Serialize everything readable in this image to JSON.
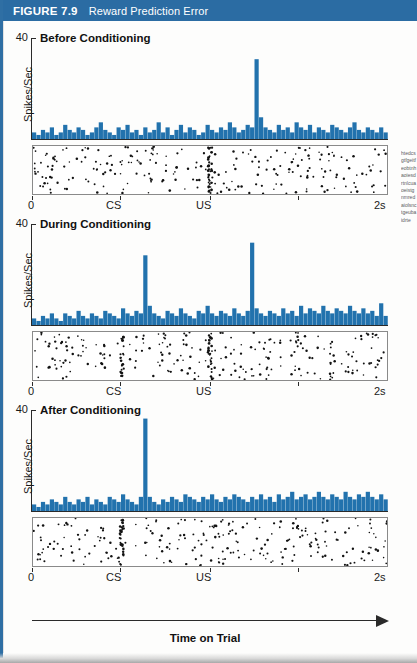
{
  "banner": {
    "figure_number": "FIGURE 7.9",
    "figure_title": "Reward Prediction Error",
    "background_color": "#2b6ca3",
    "text_color": "#ffffff"
  },
  "axes": {
    "y_max_label": "40",
    "y_axis_label": "Spikes/Sec",
    "x_tick_labels": [
      "0",
      "CS",
      "US",
      "2s"
    ],
    "x_axis_caption": "Time on Trial"
  },
  "colors": {
    "bar_blue": "#2272ad",
    "banner_blue": "#2b6ca3",
    "raster_dot": "#121212",
    "axis": "#2a2a2a"
  },
  "panels": [
    {
      "title": "Before Conditioning",
      "id": "before-conditioning"
    },
    {
      "title": "During Conditioning",
      "id": "during-conditioning"
    },
    {
      "title": "After Conditioning",
      "id": "after-conditioning"
    }
  ],
  "caption_sliver": "htedcsgtfgeitfeobtnhaoiesdrtnlcuaoeistgnmredaiolsnctgeubaidrte",
  "chart_data": {
    "type": "bar",
    "title": "Reward Prediction Error",
    "xlabel": "Time on Trial",
    "ylabel": "Spikes/Sec",
    "ylim": [
      0,
      40
    ],
    "xlim": [
      0,
      2
    ],
    "x_unit": "s",
    "grid": false,
    "legend": "none",
    "event_markers": {
      "CS": 0.5,
      "US": 1.0
    },
    "bin_width_s": 0.025,
    "n_bins": 80,
    "panels": [
      {
        "name": "Before Conditioning",
        "description": "Low irregular baseline firing with a large burst at the US (unpredicted reward).",
        "values": [
          3,
          2,
          4,
          3,
          5,
          2,
          3,
          6,
          4,
          3,
          5,
          4,
          2,
          3,
          5,
          7,
          4,
          3,
          2,
          5,
          4,
          6,
          3,
          4,
          2,
          5,
          3,
          4,
          7,
          3,
          5,
          2,
          4,
          6,
          3,
          5,
          4,
          2,
          3,
          6,
          4,
          3,
          5,
          4,
          7,
          5,
          3,
          4,
          6,
          5,
          32,
          9,
          5,
          4,
          3,
          6,
          4,
          5,
          3,
          7,
          5,
          4,
          6,
          3,
          5,
          4,
          3,
          6,
          5,
          4,
          3,
          5,
          7,
          4,
          3,
          5,
          4,
          3,
          5,
          3
        ],
        "peak_event": "US",
        "peak_value": 32
      },
      {
        "name": "During Conditioning",
        "description": "Bursts appear at both the CS and the US as the association is being learned.",
        "values": [
          3,
          2,
          4,
          3,
          5,
          3,
          2,
          5,
          4,
          3,
          6,
          4,
          3,
          5,
          4,
          3,
          6,
          5,
          4,
          3,
          7,
          5,
          4,
          6,
          5,
          28,
          8,
          5,
          4,
          3,
          6,
          5,
          4,
          7,
          5,
          4,
          3,
          6,
          5,
          8,
          5,
          4,
          6,
          5,
          4,
          7,
          5,
          4,
          6,
          33,
          7,
          5,
          4,
          6,
          5,
          4,
          7,
          5,
          6,
          4,
          8,
          5,
          7,
          6,
          5,
          8,
          6,
          5,
          7,
          6,
          5,
          8,
          6,
          5,
          7,
          5,
          6,
          4,
          9,
          4
        ],
        "peak_events": [
          "CS",
          "US"
        ],
        "peak_values": [
          28,
          33
        ]
      },
      {
        "name": "After Conditioning",
        "description": "The burst transfers entirely to the CS; the fully predicted US no longer evokes a response.",
        "values": [
          3,
          2,
          4,
          3,
          5,
          4,
          3,
          6,
          4,
          3,
          5,
          4,
          6,
          3,
          5,
          4,
          3,
          6,
          5,
          4,
          7,
          5,
          4,
          3,
          6,
          37,
          6,
          4,
          3,
          5,
          4,
          6,
          5,
          4,
          7,
          6,
          5,
          4,
          6,
          5,
          7,
          5,
          4,
          6,
          5,
          7,
          6,
          5,
          4,
          6,
          5,
          7,
          5,
          6,
          4,
          7,
          5,
          6,
          8,
          5,
          6,
          7,
          5,
          6,
          8,
          6,
          5,
          7,
          6,
          5,
          8,
          6,
          5,
          7,
          6,
          8,
          6,
          5,
          7,
          5
        ],
        "peak_event": "CS",
        "peak_value": 37,
        "us_response": 0
      }
    ]
  }
}
